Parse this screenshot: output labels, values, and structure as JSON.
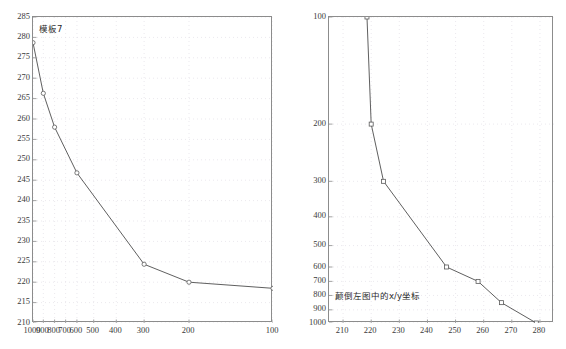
{
  "figure": {
    "background": "#ffffff",
    "line_color": "#4d4d4d",
    "axis_color": "#8c8c8c",
    "grid_color": "#e2dfe6",
    "marker_color": "#5a5a5a"
  },
  "chart_data": [
    {
      "id": "left",
      "type": "line",
      "title": "模板7",
      "xlabel": "",
      "ylabel": "",
      "grid": true,
      "legend": "none",
      "x_reversed": true,
      "x_scale": "custom-nonuniform",
      "xticks": [
        1000,
        900,
        800,
        700,
        600,
        500,
        400,
        300,
        200,
        100
      ],
      "xticklabels": [
        "1000",
        "900",
        "800",
        "700",
        "600",
        "500",
        "400",
        "300",
        "200",
        "100"
      ],
      "yticks": [
        210,
        215,
        220,
        225,
        230,
        235,
        240,
        245,
        250,
        255,
        260,
        265,
        270,
        275,
        280,
        285
      ],
      "yticklabels": [
        "210",
        "215",
        "220",
        "225",
        "230",
        "235",
        "240",
        "245",
        "250",
        "255",
        "260",
        "265",
        "270",
        "275",
        "280",
        "285"
      ],
      "ylim": [
        210,
        285
      ],
      "x": [
        1000,
        900,
        800,
        600,
        300,
        200,
        100
      ],
      "y": [
        278.7,
        266.3,
        258.0,
        246.8,
        224.4,
        220.0,
        218.5
      ],
      "marker": "circle"
    },
    {
      "id": "right",
      "type": "line",
      "title": "",
      "annotation": "颠倒左图中的x/y坐标",
      "xlabel": "",
      "ylabel": "",
      "grid": true,
      "legend": "none",
      "y_reversed": true,
      "y_scale": "custom-nonuniform",
      "xticks": [
        210,
        220,
        230,
        240,
        250,
        260,
        270,
        280
      ],
      "xticklabels": [
        "210",
        "220",
        "230",
        "240",
        "250",
        "260",
        "270",
        "280"
      ],
      "xlim": [
        205,
        285
      ],
      "yticks": [
        100,
        200,
        300,
        400,
        500,
        600,
        700,
        800,
        900,
        1000
      ],
      "yticklabels": [
        "100",
        "200",
        "300",
        "400",
        "500",
        "600",
        "700",
        "800",
        "900",
        "1000"
      ],
      "x": [
        218.5,
        220.0,
        224.4,
        246.8,
        258.0,
        266.3,
        278.7
      ],
      "y": [
        100,
        200,
        300,
        600,
        700,
        850,
        1000
      ],
      "marker": "square"
    }
  ]
}
